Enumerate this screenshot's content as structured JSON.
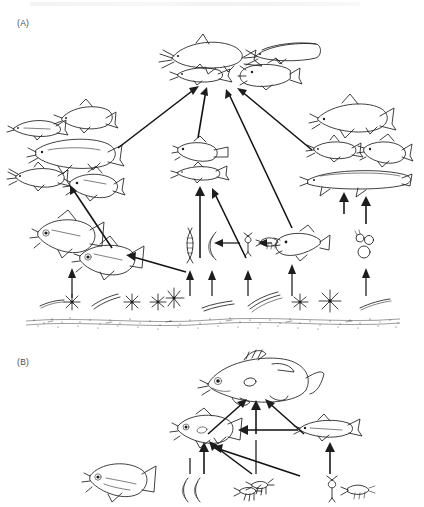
{
  "figure": {
    "type": "food-web-diagram",
    "background": "#ffffff",
    "ink_color": "#1d1d1d",
    "top_partial_text": "",
    "panels": [
      {
        "id": "A",
        "label": "(A)",
        "description": "Multi-level littoral food web with piscivores at top, planktivores and benthivores in middle, invertebrates and algae at base over sediment substrate",
        "levels": [
          {
            "name": "top-predators",
            "organisms": [
              {
                "id": "a-catfish",
                "icon": "catfish-fish-icon",
                "x": 170,
                "y": 47,
                "w": 72,
                "h": 26,
                "flip": false
              },
              {
                "id": "a-cylinder-fish",
                "icon": "elongate-fish-icon",
                "x": 252,
                "y": 45,
                "w": 66,
                "h": 22,
                "flip": false
              },
              {
                "id": "a-minnow-top",
                "icon": "minnow-fish-icon",
                "x": 176,
                "y": 72,
                "w": 54,
                "h": 18,
                "flip": false
              },
              {
                "id": "a-cichlid-top",
                "icon": "cichlid-fish-icon",
                "x": 236,
                "y": 70,
                "w": 56,
                "h": 22,
                "flip": true
              }
            ]
          },
          {
            "name": "left-cluster",
            "organisms": [
              {
                "id": "a-left-1",
                "icon": "minnow-fish-icon",
                "x": 10,
                "y": 122,
                "w": 52,
                "h": 18,
                "flip": true
              },
              {
                "id": "a-left-2",
                "icon": "chub-fish-icon",
                "x": 62,
                "y": 110,
                "w": 50,
                "h": 20,
                "flip": false
              },
              {
                "id": "a-left-3",
                "icon": "carp-fish-icon",
                "x": 34,
                "y": 140,
                "w": 78,
                "h": 26,
                "flip": false
              },
              {
                "id": "a-left-4",
                "icon": "catfish-fish-icon",
                "x": 14,
                "y": 168,
                "w": 54,
                "h": 20,
                "flip": false
              },
              {
                "id": "a-left-5",
                "icon": "cichlid-fish-icon",
                "x": 66,
                "y": 172,
                "w": 54,
                "h": 22,
                "flip": false
              }
            ]
          },
          {
            "name": "right-cluster",
            "organisms": [
              {
                "id": "a-right-1",
                "icon": "chub-fish-icon",
                "x": 318,
                "y": 100,
                "w": 72,
                "h": 26,
                "flip": false
              },
              {
                "id": "a-right-2",
                "icon": "catfish-fish-icon",
                "x": 312,
                "y": 142,
                "w": 48,
                "h": 18,
                "flip": false
              },
              {
                "id": "a-right-3",
                "icon": "cichlid-fish-icon",
                "x": 362,
                "y": 140,
                "w": 50,
                "h": 22,
                "flip": false
              },
              {
                "id": "a-right-4",
                "icon": "eel-fish-icon",
                "x": 306,
                "y": 172,
                "w": 102,
                "h": 22,
                "flip": false
              }
            ]
          },
          {
            "name": "center-cluster",
            "organisms": [
              {
                "id": "a-center-1",
                "icon": "cichlid-fish-icon",
                "x": 176,
                "y": 142,
                "w": 50,
                "h": 20,
                "flip": false
              },
              {
                "id": "a-center-2",
                "icon": "minnow-fish-icon",
                "x": 176,
                "y": 166,
                "w": 52,
                "h": 16,
                "flip": false
              }
            ]
          },
          {
            "name": "lower-fish",
            "organisms": [
              {
                "id": "a-low-1",
                "icon": "cichlid-fish-icon",
                "x": 36,
                "y": 218,
                "w": 58,
                "h": 28,
                "flip": false
              },
              {
                "id": "a-low-2",
                "icon": "cichlid-fish-icon",
                "x": 78,
                "y": 244,
                "w": 56,
                "h": 26,
                "flip": false
              },
              {
                "id": "a-low-3",
                "icon": "cichlid-fish-icon",
                "x": 274,
                "y": 232,
                "w": 46,
                "h": 22,
                "flip": true
              }
            ]
          },
          {
            "name": "invertebrates",
            "organisms": [
              {
                "id": "a-larva",
                "icon": "insect-larva-icon",
                "x": 186,
                "y": 230,
                "w": 8,
                "h": 26
              },
              {
                "id": "a-worm",
                "icon": "worm-icon",
                "x": 208,
                "y": 230,
                "w": 10,
                "h": 26
              },
              {
                "id": "a-copepod",
                "icon": "copepod-icon",
                "x": 246,
                "y": 234,
                "w": 10,
                "h": 16
              },
              {
                "id": "a-shrimp",
                "icon": "shrimp-icon",
                "x": 258,
                "y": 238,
                "w": 16,
                "h": 10
              },
              {
                "id": "a-snails",
                "icon": "snail-cluster-icon",
                "x": 356,
                "y": 232,
                "w": 20,
                "h": 28
              }
            ]
          },
          {
            "name": "algae-substrate",
            "organisms": [
              {
                "id": "a-alg-1",
                "icon": "filament-algae-icon",
                "x": 42,
                "y": 302
              },
              {
                "id": "a-alg-2",
                "icon": "star-diatom-icon",
                "x": 72,
                "y": 300
              },
              {
                "id": "a-alg-3",
                "icon": "filament-algae-icon",
                "x": 96,
                "y": 300
              },
              {
                "id": "a-alg-4",
                "icon": "star-diatom-icon",
                "x": 132,
                "y": 302
              },
              {
                "id": "a-alg-5",
                "icon": "star-diatom-icon",
                "x": 158,
                "y": 301
              },
              {
                "id": "a-alg-6",
                "icon": "star-diatom-icon",
                "x": 174,
                "y": 298
              },
              {
                "id": "a-alg-7",
                "icon": "filament-algae-icon",
                "x": 208,
                "y": 305
              },
              {
                "id": "a-alg-8",
                "icon": "filament-algae-icon",
                "x": 252,
                "y": 300
              },
              {
                "id": "a-alg-9",
                "icon": "star-diatom-icon",
                "x": 300,
                "y": 302
              },
              {
                "id": "a-alg-10",
                "icon": "star-diatom-icon",
                "x": 330,
                "y": 300
              },
              {
                "id": "a-alg-11",
                "icon": "filament-algae-icon",
                "x": 366,
                "y": 303
              }
            ],
            "substrate": {
              "id": "a-sediment",
              "icon": "sediment-band-icon",
              "y": 318,
              "label": ""
            }
          }
        ],
        "link_count": 24
      },
      {
        "id": "B",
        "label": "(B)",
        "description": "Simplified food web with one apex predator, two mid-level fish, and benthic invertebrates",
        "levels": [
          {
            "name": "apex",
            "organisms": [
              {
                "id": "b-apex",
                "icon": "bass-fish-icon",
                "x": 208,
                "y": 360,
                "w": 96,
                "h": 40,
                "flip": false
              }
            ]
          },
          {
            "name": "mid",
            "organisms": [
              {
                "id": "b-mid-left",
                "icon": "cichlid-fish-icon",
                "x": 176,
                "y": 424,
                "w": 60,
                "h": 24,
                "flip": false
              },
              {
                "id": "b-mid-right",
                "icon": "minnow-fish-icon",
                "x": 310,
                "y": 428,
                "w": 52,
                "h": 18,
                "flip": false
              }
            ]
          },
          {
            "name": "base",
            "organisms": [
              {
                "id": "b-base-fish",
                "icon": "cichlid-fish-icon",
                "x": 88,
                "y": 474,
                "w": 62,
                "h": 26,
                "flip": false
              },
              {
                "id": "b-worm-1",
                "icon": "worm-icon",
                "x": 186,
                "y": 480,
                "w": 9,
                "h": 22
              },
              {
                "id": "b-worm-2",
                "icon": "worm-icon",
                "x": 196,
                "y": 480,
                "w": 9,
                "h": 22
              },
              {
                "id": "b-nymph-1",
                "icon": "mayfly-nymph-icon",
                "x": 246,
                "y": 478,
                "w": 18,
                "h": 14
              },
              {
                "id": "b-nymph-2",
                "icon": "mayfly-nymph-icon",
                "x": 262,
                "y": 484,
                "w": 18,
                "h": 14
              },
              {
                "id": "b-copepod-b",
                "icon": "copepod-icon",
                "x": 330,
                "y": 480,
                "w": 12,
                "h": 18
              },
              {
                "id": "b-shrimp-b",
                "icon": "shrimp-icon",
                "x": 346,
                "y": 488,
                "w": 18,
                "h": 11
              }
            ]
          }
        ],
        "link_count": 10
      }
    ]
  }
}
